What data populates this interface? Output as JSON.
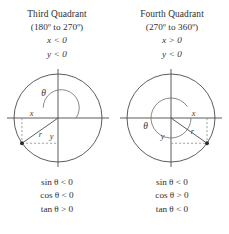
{
  "figure": {
    "width": 229,
    "height": 234,
    "background_color": "#ffffff",
    "stroke_color": "#4a4a4a",
    "dash_color": "#8a8a8a",
    "text_color": "#2e2e2e"
  },
  "panels": [
    {
      "id": "third-quadrant",
      "header": {
        "title": "Third Quadrant",
        "range": "(180º to 270º)",
        "x_sign": "x < 0",
        "y_sign": "y < 0"
      },
      "diagram": {
        "labels": {
          "theta": "θ",
          "x": "x",
          "y": "y",
          "r": "r"
        },
        "terminal_angle_deg": 215,
        "point_quadrant": 3
      },
      "footer": {
        "sin": "sin θ < 0",
        "cos": "cos θ < 0",
        "tan": "tan θ > 0"
      }
    },
    {
      "id": "fourth-quadrant",
      "header": {
        "title": "Fourth Quadrant",
        "range": "(270º to 360º)",
        "x_sign": "x > 0",
        "y_sign": "y < 0"
      },
      "diagram": {
        "labels": {
          "theta": "θ",
          "x": "x",
          "y": "y",
          "r": "r"
        },
        "terminal_angle_deg": 325,
        "point_quadrant": 4
      },
      "footer": {
        "sin": "sin θ < 0",
        "cos": "cos θ > 0",
        "tan": "tan θ < 0"
      }
    }
  ]
}
